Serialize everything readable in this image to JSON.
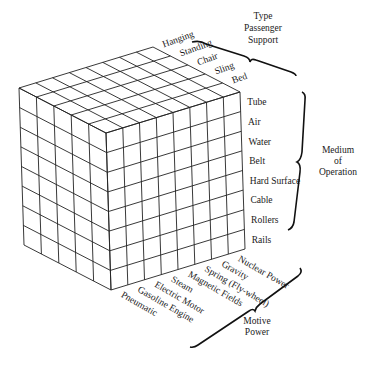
{
  "diagram": {
    "type": "morphological-box",
    "axes": {
      "passenger_support": {
        "title_lines": [
          "Type",
          "Passenger",
          "Support"
        ],
        "items": [
          "Hanging",
          "Standing",
          "Chair",
          "Sling",
          "Bed"
        ]
      },
      "medium_of_operation": {
        "title_lines": [
          "Medium",
          "of",
          "Operation"
        ],
        "items": [
          "Tube",
          "Air",
          "Water",
          "Belt",
          "Hard Surface",
          "Cable",
          "Rollers",
          "Rails"
        ]
      },
      "motive_power": {
        "title_lines": [
          "Motive",
          "Power"
        ],
        "items": [
          "Nuclear Power",
          "Gravity",
          "Spring (Fly-wheel)",
          "Magnetic Fields",
          "Steam",
          "Electric Motor",
          "Gasoline Engine",
          "Pneumatic"
        ]
      }
    }
  }
}
